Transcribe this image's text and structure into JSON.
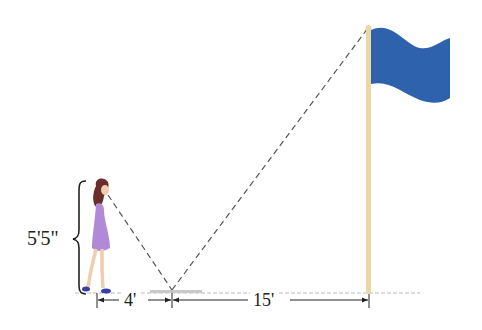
{
  "figure": {
    "person_height_label": "5'5\"",
    "distance_person_to_mirror_label": "4'",
    "distance_mirror_to_flagpole_label": "15'",
    "colors": {
      "flag": "#2f62ad",
      "pole": "#ead7a6",
      "dress": "#b08ad6",
      "hair": "#6b2e2a",
      "skin": "#f0cdb0",
      "shoes": "#3a3fa8",
      "ground": "#bbbbbb",
      "sight_line": "#555555",
      "text": "#222222"
    },
    "elements": [
      "person",
      "mirror",
      "flagpole",
      "flag",
      "sight lines",
      "ground line",
      "height brace",
      "dimension arrows"
    ]
  }
}
